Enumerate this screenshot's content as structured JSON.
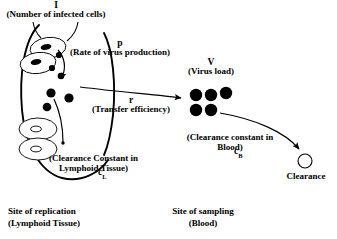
{
  "figure": {
    "title_symbols": {
      "infected_cells": "I",
      "virus_production": "p",
      "virus_load": "V",
      "transfer_efficiency": "r",
      "clearance_blood_main": "c",
      "clearance_blood_sub": "B",
      "clearance_lymphoid_main": "c",
      "clearance_lymphoid_sub": "L"
    },
    "labels": {
      "infected_cells_desc": "(Number of infected cells)",
      "virus_production_desc": "(Rate of virus production)",
      "virus_load_desc": "(Virus load)",
      "transfer_efficiency_desc": "(Transfer efficiency)",
      "clearance_blood_desc_line1": "(Clearance constant in",
      "clearance_blood_desc_line2": "Blood)",
      "clearance_lymphoid_desc_line1": "(Clearance Constant in",
      "clearance_lymphoid_desc_line2": "Lymphoid Tissue)",
      "clearance_outcome": "Clearance"
    },
    "sites": {
      "replication_line1": "Site of replication",
      "replication_line2": "(Lymphoid Tissue)",
      "sampling_line1": "Site of sampling",
      "sampling_line2": "(Blood)"
    },
    "colors": {
      "stroke": "#000000",
      "fill_virion": "#000000",
      "background": "#ffffff",
      "cell_fill": "#ffffff"
    },
    "counts": {
      "infected_cells": 2,
      "free_virions_lymphoid": 6,
      "virus_load_particles": 5,
      "cleared_cells": 2
    }
  }
}
